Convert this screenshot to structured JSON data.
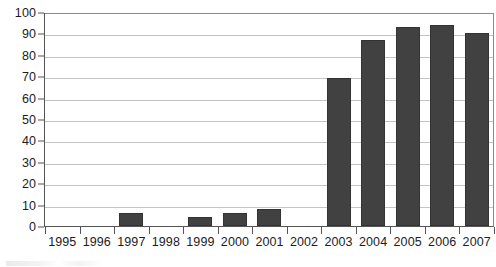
{
  "chart_data": {
    "type": "bar",
    "title": "",
    "subtitle": "",
    "xlabel": "",
    "ylabel": "",
    "categories": [
      "1995",
      "1996",
      "1997",
      "1998",
      "1999",
      "2000",
      "2001",
      "2002",
      "2003",
      "2004",
      "2005",
      "2006",
      "2007"
    ],
    "values": [
      0,
      0,
      6,
      0,
      4,
      6,
      8,
      0,
      69,
      87,
      93,
      94,
      90
    ],
    "series": [
      {
        "name": "",
        "values": [
          0,
          0,
          6,
          0,
          4,
          6,
          8,
          0,
          69,
          87,
          93,
          94,
          90
        ]
      }
    ],
    "ylim": [
      0,
      100
    ],
    "y_ticks": [
      0,
      10,
      20,
      30,
      40,
      50,
      60,
      70,
      80,
      90,
      100
    ],
    "y_tick_labels": [
      "0",
      "10",
      "20",
      "30",
      "40",
      "50",
      "60",
      "70",
      "80",
      "90",
      "100"
    ],
    "x_tick_labels": [
      "1995",
      "1996",
      "1997",
      "1998",
      "1999",
      "2000",
      "2001",
      "2002",
      "2003",
      "2004",
      "2005",
      "2006",
      "2007"
    ],
    "grid": true,
    "grid_axis": "y",
    "legend": false,
    "legend_position": "none",
    "annotations": [],
    "colors": {
      "bar_fill": "#414141",
      "bar_edge": "#333333",
      "gridline": "#c4c4c4",
      "axis_line": "#555555",
      "plot_border": "#8a8a8a",
      "text": "#1c1c1c",
      "background": "#ffffff"
    }
  }
}
